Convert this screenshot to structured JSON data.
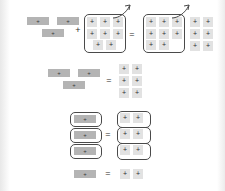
{
  "document": {
    "kind": "math-manipulative-diagram",
    "background_color": "#ffffff",
    "bar_color": "#b4b4b4",
    "square_color": "#e2e2e2",
    "ink_color": "#4a4a4a"
  },
  "glyphs": {
    "plus_tile": "+",
    "plus_operator": "+",
    "equals_operator": "=",
    "arrow": "arrow-up-right-icon"
  },
  "rows": [
    {
      "id": "row-1",
      "left_group": {
        "label": "three-bar-group",
        "bars": [
          "+",
          "+",
          "+"
        ]
      },
      "operator_1": "+",
      "middle_group": {
        "label": "boxed-eight-squares",
        "boxed": true,
        "has_arrow": true,
        "square_rows": [
          [
            "+",
            "+",
            "+"
          ],
          [
            "+",
            "+",
            "+"
          ],
          [
            "+",
            "+"
          ]
        ]
      },
      "operator_2": "=",
      "right_group": {
        "label": "boxed-eight-squares-result",
        "boxed": true,
        "has_arrow": true,
        "square_rows": [
          [
            "+",
            "+",
            "+"
          ],
          [
            "+",
            "+",
            "+"
          ],
          [
            "+",
            "+"
          ]
        ]
      },
      "trailing_group": {
        "label": "six-squares",
        "boxed": false,
        "square_rows": [
          [
            "+",
            "+"
          ],
          [
            "+",
            "+"
          ],
          [
            "+",
            "+"
          ]
        ]
      }
    },
    {
      "id": "row-2",
      "left_group": {
        "label": "three-bar-group",
        "bars": [
          "+",
          "+",
          "+"
        ]
      },
      "operator_2": "=",
      "right_group": {
        "label": "six-squares",
        "boxed": false,
        "square_rows": [
          [
            "+",
            "+"
          ],
          [
            "+",
            "+"
          ],
          [
            "+",
            "+"
          ]
        ]
      }
    },
    {
      "id": "row-3",
      "left_group": {
        "label": "three-boxed-bars",
        "boxed_bars": [
          "+",
          "+",
          "+"
        ]
      },
      "operator_2": "=",
      "right_group": {
        "label": "three-boxed-square-pairs",
        "boxed_pairs": [
          [
            "+",
            "+"
          ],
          [
            "+",
            "+"
          ],
          [
            "+",
            "+"
          ]
        ]
      }
    },
    {
      "id": "row-4",
      "left_group": {
        "label": "single-bar",
        "bars": [
          "+"
        ]
      },
      "operator_2": "=",
      "right_group": {
        "label": "two-squares",
        "boxed": false,
        "square_rows": [
          [
            "+",
            "+"
          ]
        ]
      }
    }
  ]
}
